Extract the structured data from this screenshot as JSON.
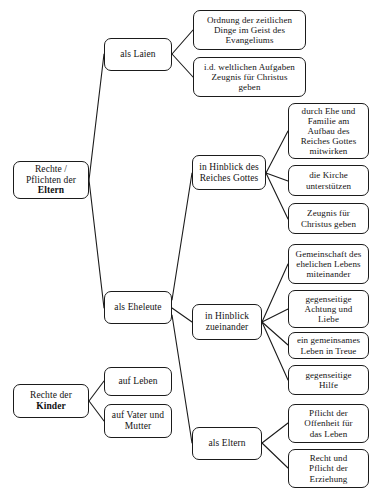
{
  "diagram": {
    "type": "mind-map",
    "canvas": {
      "width": 376,
      "height": 501
    },
    "style": {
      "background_color": "#ffffff",
      "node_border_color": "#1b1b1b",
      "node_fill_color": "#ffffff",
      "edge_color": "#1b1b1b",
      "text_color": "#121212"
    },
    "nodes": [
      {
        "id": "root-eltern",
        "name": "root-rechte-pflichten-eltern",
        "kind": "root",
        "line1": "Rechte /",
        "line2": "Pflichten der",
        "line3": "Eltern",
        "bold_line": "Eltern",
        "x": 13,
        "y": 161,
        "w": 76,
        "h": 38
      },
      {
        "id": "als-laien",
        "name": "branch-als-laien",
        "kind": "branch",
        "label": "als Laien",
        "x": 104,
        "y": 38,
        "w": 68,
        "h": 33
      },
      {
        "id": "ordnung-zeitlichen",
        "name": "leaf-ordnung-der-zeitlichen-dinge",
        "kind": "leaf",
        "label": "Ordnung der zeitlichen\nDinge im Geist des\nEvangeliums",
        "x": 193,
        "y": 10,
        "w": 113,
        "h": 40
      },
      {
        "id": "weltliche-aufgaben",
        "name": "leaf-id-weltlichen-aufgaben-zeugnis",
        "kind": "leaf",
        "label": "i.d. weltlichen Aufgaben\nZeugnis für Christus\ngeben",
        "x": 193,
        "y": 57,
        "w": 113,
        "h": 40
      },
      {
        "id": "als-eheleute",
        "name": "branch-als-eheleute",
        "kind": "branch",
        "label": "als Eheleute",
        "x": 104,
        "y": 291,
        "w": 68,
        "h": 33
      },
      {
        "id": "hinblick-reiches-gottes",
        "name": "branch-in-hinblick-des-reiches-gottes",
        "kind": "branch",
        "label": "in Hinblick des\nReiches Gottes",
        "x": 192,
        "y": 155,
        "w": 74,
        "h": 35
      },
      {
        "id": "durch-ehe-familie",
        "name": "leaf-durch-ehe-und-familie-aufbau",
        "kind": "leaf",
        "label": "durch Ehe und\nFamilie am\nAufbau des\nReiches Gottes\nmitwirken",
        "x": 288,
        "y": 103,
        "w": 81,
        "h": 56
      },
      {
        "id": "kirche-unterstuetzen",
        "name": "leaf-die-kirche-unterstuetzen",
        "kind": "leaf",
        "label": "die Kirche\nunterstützen",
        "x": 288,
        "y": 165,
        "w": 81,
        "h": 31
      },
      {
        "id": "zeugnis-christus",
        "name": "leaf-zeugnis-fuer-christus-geben",
        "kind": "leaf",
        "label": "Zeugnis für\nChristus geben",
        "x": 288,
        "y": 203,
        "w": 81,
        "h": 31
      },
      {
        "id": "hinblick-zueinander",
        "name": "branch-in-hinblick-zueinander",
        "kind": "branch",
        "label": "in Hinblick\nzueinander",
        "x": 192,
        "y": 304,
        "w": 70,
        "h": 36
      },
      {
        "id": "gemeinschaft-ehelichen",
        "name": "leaf-gemeinschaft-des-ehelichen-lebens",
        "kind": "leaf",
        "label": "Gemeinschaft des\nehelichen Lebens\nmiteinander",
        "x": 288,
        "y": 244,
        "w": 81,
        "h": 40
      },
      {
        "id": "gegenseitige-achtung",
        "name": "leaf-gegenseitige-achtung-und-liebe",
        "kind": "leaf",
        "label": "gegenseitige\nAchtung und\nLiebe",
        "x": 288,
        "y": 290,
        "w": 81,
        "h": 38
      },
      {
        "id": "gemeinsames-leben-treue",
        "name": "leaf-ein-gemeinsames-leben-in-treue",
        "kind": "leaf",
        "label": "ein gemeinsames\nLeben in Treue",
        "x": 288,
        "y": 332,
        "w": 81,
        "h": 27
      },
      {
        "id": "gegenseitige-hilfe",
        "name": "leaf-gegenseitige-hilfe",
        "kind": "leaf",
        "label": "gegenseitige\nHilfe",
        "x": 288,
        "y": 365,
        "w": 81,
        "h": 30
      },
      {
        "id": "als-eltern",
        "name": "branch-als-eltern",
        "kind": "branch",
        "label": "als Eltern",
        "x": 192,
        "y": 427,
        "w": 70,
        "h": 33
      },
      {
        "id": "pflicht-offenheit",
        "name": "leaf-pflicht-der-offenheit-fuer-das-leben",
        "kind": "leaf",
        "label": "Pflicht der\nOffenheit für\ndas Leben",
        "x": 288,
        "y": 404,
        "w": 81,
        "h": 39
      },
      {
        "id": "recht-pflicht-erziehung",
        "name": "leaf-recht-und-pflicht-der-erziehung",
        "kind": "leaf",
        "label": "Recht und\nPflicht der\nErziehung",
        "x": 288,
        "y": 449,
        "w": 81,
        "h": 39
      },
      {
        "id": "root-kinder",
        "name": "root-rechte-der-kinder",
        "kind": "root",
        "line1": "Rechte der",
        "line2": "Kinder",
        "bold_line": "Kinder",
        "x": 13,
        "y": 384,
        "w": 76,
        "h": 34
      },
      {
        "id": "auf-leben",
        "name": "leaf-auf-leben",
        "kind": "branch",
        "label": "auf Leben",
        "x": 104,
        "y": 367,
        "w": 68,
        "h": 29
      },
      {
        "id": "auf-vater-mutter",
        "name": "leaf-auf-vater-und-mutter",
        "kind": "branch",
        "label": "auf Vater und\nMutter",
        "x": 104,
        "y": 404,
        "w": 68,
        "h": 34
      }
    ],
    "edges": [
      {
        "name": "edge-root-eltern-to-als-laien",
        "from": "root-eltern",
        "to": "als-laien",
        "x1": 89,
        "y1": 180,
        "x2": 104,
        "y2": 54
      },
      {
        "name": "edge-root-eltern-to-als-eheleute",
        "from": "root-eltern",
        "to": "als-eheleute",
        "x1": 89,
        "y1": 180,
        "x2": 104,
        "y2": 308
      },
      {
        "name": "edge-als-laien-to-ordnung",
        "from": "als-laien",
        "to": "ordnung-zeitlichen",
        "x1": 172,
        "y1": 54,
        "x2": 193,
        "y2": 30
      },
      {
        "name": "edge-als-laien-to-weltliche-aufgaben",
        "from": "als-laien",
        "to": "weltliche-aufgaben",
        "x1": 172,
        "y1": 54,
        "x2": 193,
        "y2": 77
      },
      {
        "name": "edge-als-eheleute-to-hinblick-reiches-gottes",
        "from": "als-eheleute",
        "to": "hinblick-reiches-gottes",
        "x1": 172,
        "y1": 300,
        "x2": 192,
        "y2": 173
      },
      {
        "name": "edge-als-eheleute-to-hinblick-zueinander",
        "from": "als-eheleute",
        "to": "hinblick-zueinander",
        "x1": 172,
        "y1": 308,
        "x2": 192,
        "y2": 322
      },
      {
        "name": "edge-als-eheleute-to-als-eltern",
        "from": "als-eheleute",
        "to": "als-eltern",
        "x1": 172,
        "y1": 315,
        "x2": 192,
        "y2": 443
      },
      {
        "name": "edge-reiches-gottes-to-durch-ehe",
        "from": "hinblick-reiches-gottes",
        "to": "durch-ehe-familie",
        "x1": 266,
        "y1": 173,
        "x2": 288,
        "y2": 131
      },
      {
        "name": "edge-reiches-gottes-to-kirche",
        "from": "hinblick-reiches-gottes",
        "to": "kirche-unterstuetzen",
        "x1": 266,
        "y1": 173,
        "x2": 288,
        "y2": 181
      },
      {
        "name": "edge-reiches-gottes-to-zeugnis",
        "from": "hinblick-reiches-gottes",
        "to": "zeugnis-christus",
        "x1": 266,
        "y1": 173,
        "x2": 288,
        "y2": 219
      },
      {
        "name": "edge-zueinander-to-gemeinschaft",
        "from": "hinblick-zueinander",
        "to": "gemeinschaft-ehelichen",
        "x1": 262,
        "y1": 322,
        "x2": 288,
        "y2": 264
      },
      {
        "name": "edge-zueinander-to-achtung",
        "from": "hinblick-zueinander",
        "to": "gegenseitige-achtung",
        "x1": 262,
        "y1": 322,
        "x2": 288,
        "y2": 309
      },
      {
        "name": "edge-zueinander-to-treue",
        "from": "hinblick-zueinander",
        "to": "gemeinsames-leben-treue",
        "x1": 262,
        "y1": 322,
        "x2": 288,
        "y2": 345
      },
      {
        "name": "edge-zueinander-to-hilfe",
        "from": "hinblick-zueinander",
        "to": "gegenseitige-hilfe",
        "x1": 262,
        "y1": 322,
        "x2": 288,
        "y2": 380
      },
      {
        "name": "edge-als-eltern-to-offenheit",
        "from": "als-eltern",
        "to": "pflicht-offenheit",
        "x1": 262,
        "y1": 443,
        "x2": 288,
        "y2": 423
      },
      {
        "name": "edge-als-eltern-to-erziehung",
        "from": "als-eltern",
        "to": "recht-pflicht-erziehung",
        "x1": 262,
        "y1": 443,
        "x2": 288,
        "y2": 468
      },
      {
        "name": "edge-root-kinder-to-auf-leben",
        "from": "root-kinder",
        "to": "auf-leben",
        "x1": 89,
        "y1": 401,
        "x2": 104,
        "y2": 381
      },
      {
        "name": "edge-root-kinder-to-auf-vater-mutter",
        "from": "root-kinder",
        "to": "auf-vater-mutter",
        "x1": 89,
        "y1": 401,
        "x2": 104,
        "y2": 421
      }
    ]
  }
}
